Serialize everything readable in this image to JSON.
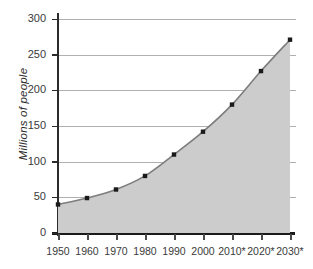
{
  "chart_data": {
    "type": "area",
    "title": "",
    "xlabel": "",
    "ylabel": "Millions of people",
    "categories": [
      "1950",
      "1960",
      "1970",
      "1980",
      "1990",
      "2000",
      "2010*",
      "2020*",
      "2030*"
    ],
    "values": [
      40,
      49,
      61,
      80,
      110,
      142,
      180,
      227,
      271
    ],
    "ylim": [
      0,
      300
    ],
    "yticks": [
      0,
      50,
      100,
      150,
      200,
      250,
      300
    ],
    "ytick_labels": [
      "0",
      "50",
      "100",
      "150",
      "200",
      "250",
      "300"
    ],
    "grid": true,
    "legend": false,
    "annotations": [
      "* indicates projected values"
    ],
    "colors": {
      "line": "#7d7d7d",
      "fill": "#cccccc",
      "marker": "#1a1a1a",
      "grid": "#b0b0b0",
      "axis": "#1a1a1a",
      "text": "#3a3a3a"
    }
  }
}
